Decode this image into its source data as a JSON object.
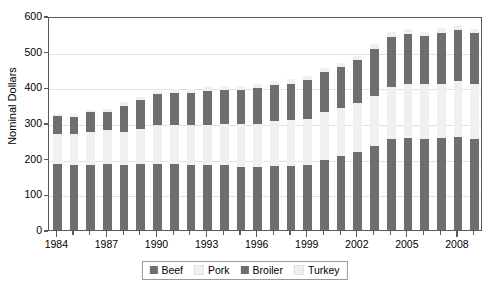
{
  "chart_data": {
    "type": "bar",
    "stacked": true,
    "title": "",
    "subtitle": "",
    "xlabel": "",
    "ylabel": "Nominal Dollars",
    "ylim": [
      0,
      600
    ],
    "ytick_values": [
      0,
      100,
      200,
      300,
      400,
      500,
      600
    ],
    "ytick_labels": [
      "0",
      "100",
      "200",
      "300",
      "400",
      "500",
      "600"
    ],
    "grid": true,
    "legend_position": "bottom-center",
    "categories": [
      "1984",
      "1985",
      "1986",
      "1987",
      "1988",
      "1989",
      "1990",
      "1991",
      "1992",
      "1993",
      "1994",
      "1995",
      "1996",
      "1997",
      "1998",
      "1999",
      "2000",
      "2001",
      "2002",
      "2003",
      "2004",
      "2005",
      "2006",
      "2007",
      "2008",
      "2009"
    ],
    "xtick_labels": [
      "1984",
      "1987",
      "1990",
      "1993",
      "1996",
      "1999",
      "2002",
      "2005",
      "2008"
    ],
    "series": [
      {
        "name": "Beef",
        "color": "#6e6e6e",
        "values": [
          184,
          183,
          183,
          184,
          181,
          184,
          186,
          186,
          183,
          183,
          181,
          178,
          176,
          179,
          180,
          183,
          196,
          207,
          219,
          235,
          255,
          258,
          255,
          258,
          260,
          254
        ]
      },
      {
        "name": "Pork",
        "color": "#f0f0ec",
        "values": [
          86,
          85,
          93,
          96,
          95,
          99,
          107,
          109,
          110,
          112,
          116,
          118,
          122,
          126,
          128,
          129,
          134,
          134,
          137,
          142,
          147,
          151,
          153,
          152,
          157,
          156
        ]
      },
      {
        "name": "Broiler",
        "color": "#6e6e6e",
        "values": [
          50,
          50,
          54,
          52,
          73,
          81,
          87,
          88,
          92,
          95,
          96,
          97,
          100,
          101,
          102,
          108,
          112,
          116,
          120,
          131,
          140,
          140,
          135,
          141,
          143,
          141
        ]
      },
      {
        "name": "Turkey",
        "color": "#f0f0ec",
        "values": [
          6,
          6,
          7,
          7,
          10,
          10,
          11,
          11,
          11,
          11,
          11,
          11,
          12,
          12,
          12,
          12,
          12,
          12,
          12,
          13,
          14,
          14,
          13,
          14,
          14,
          13
        ]
      }
    ]
  },
  "legend": {
    "items": [
      {
        "label": "Beef",
        "swatch_class": "sw-beef"
      },
      {
        "label": "Pork",
        "swatch_class": "sw-pork"
      },
      {
        "label": "Broiler",
        "swatch_class": "sw-broiler"
      },
      {
        "label": "Turkey",
        "swatch_class": "sw-turkey"
      }
    ]
  },
  "colors": {
    "dark": "#6e6e6e",
    "light": "#f0f0ec",
    "axis": "#5a5a5a",
    "grid": "#e2e2e2",
    "text": "#000000",
    "background": "#ffffff"
  }
}
